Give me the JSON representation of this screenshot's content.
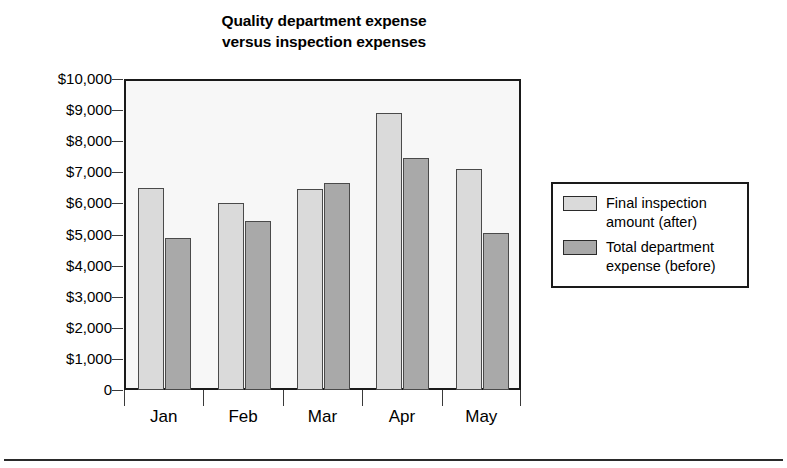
{
  "chart_data": {
    "type": "bar",
    "title": "Quality department expense versus inspection expenses",
    "title_line1": "Quality department expense",
    "title_line2": "versus inspection expenses",
    "categories": [
      "Jan",
      "Feb",
      "Mar",
      "Apr",
      "May"
    ],
    "series": [
      {
        "name": "Final inspection amount (after)",
        "name_line1": "Final inspection",
        "name_line2": "amount (after)",
        "color": "#dadada",
        "values": [
          6500,
          6000,
          6450,
          8900,
          7100
        ]
      },
      {
        "name": "Total department expense (before)",
        "name_line1": "Total department",
        "name_line2": "expense (before)",
        "color": "#a9a9a9",
        "values": [
          4900,
          5450,
          6650,
          7450,
          5050
        ]
      }
    ],
    "xlabel": "",
    "ylabel": "",
    "ylim": [
      0,
      10000
    ],
    "ytick_values": [
      10000,
      9000,
      8000,
      7000,
      6000,
      5000,
      4000,
      3000,
      2000,
      1000,
      0
    ],
    "ytick_labels": [
      "$10,000",
      "$9,000",
      "$8,000",
      "$7,000",
      "$6,000",
      "$5,000",
      "$4,000",
      "$3,000",
      "$2,000",
      "$1,000",
      "0"
    ],
    "grid": false,
    "legend_position": "right",
    "plot_background": "#f7f7f7",
    "axis_color": "#1a1a1a"
  }
}
